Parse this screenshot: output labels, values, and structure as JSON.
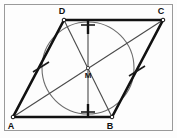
{
  "figure": {
    "kind": "geometry-diagram",
    "canvas": {
      "width": 177,
      "height": 138
    },
    "frame": {
      "x": 4,
      "y": 4,
      "width": 169,
      "height": 127,
      "stroke": "#9a9a9a",
      "fill": "#fdfdfd",
      "stroke_width": 1
    },
    "colors": {
      "outline": "#111111",
      "thin_line": "#555555",
      "circle": "#666666",
      "tick": "#222222",
      "label": "#111111",
      "background": "#fdfdfd",
      "frame": "#9a9a9a"
    },
    "points": [
      {
        "name": "A",
        "label": "A",
        "x": 13,
        "y": 117,
        "label_x": 11,
        "label_y": 129
      },
      {
        "name": "B",
        "label": "B",
        "x": 112,
        "y": 117,
        "label_x": 110,
        "label_y": 129
      },
      {
        "name": "C",
        "label": "C",
        "x": 163,
        "y": 20,
        "label_x": 160,
        "label_y": 14
      },
      {
        "name": "D",
        "label": "D",
        "x": 64,
        "y": 20,
        "label_x": 61,
        "label_y": 14
      },
      {
        "name": "M",
        "label": "M",
        "x": 88,
        "y": 68,
        "label_x": 85,
        "label_y": 78
      }
    ],
    "polygon": {
      "name": "rhombus-ABCD",
      "vertices": "13,117 112,117 163,20 64,20",
      "stroke_width": 2.6
    },
    "circle": {
      "name": "inscribed-circle",
      "cx": 88,
      "cy": 68,
      "r": 46,
      "stroke_width": 1.1
    },
    "diagonals": [
      {
        "name": "diagonal-AC",
        "x1": 13,
        "y1": 117,
        "x2": 163,
        "y2": 20
      },
      {
        "name": "diagonal-BD",
        "x1": 112,
        "y1": 117,
        "x2": 64,
        "y2": 20
      }
    ],
    "axis": {
      "name": "vertical-axis-of-symmetry",
      "x1": 88,
      "y1": 20,
      "x2": 88,
      "y2": 117
    },
    "ticks": [
      {
        "name": "tick-side-AD",
        "x1": 33,
        "y1": 72,
        "x2": 49,
        "y2": 62
      },
      {
        "name": "tick-side-BC",
        "x1": 129,
        "y1": 76,
        "x2": 145,
        "y2": 66
      },
      {
        "name": "tick-axis-top",
        "x1": 81,
        "y1": 25,
        "x2": 95,
        "y2": 25
      },
      {
        "name": "tick-axis-bottom",
        "x1": 81,
        "y1": 112,
        "x2": 95,
        "y2": 112
      }
    ],
    "axis_segments": [
      {
        "name": "axis-top-stub",
        "x1": 88,
        "y1": 20,
        "x2": 88,
        "y2": 34
      },
      {
        "name": "axis-bottom-stub",
        "x1": 88,
        "y1": 104,
        "x2": 88,
        "y2": 117
      }
    ]
  }
}
